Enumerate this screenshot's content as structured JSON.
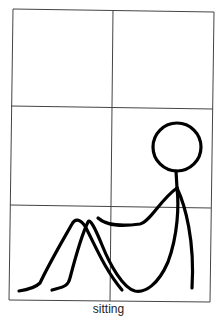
{
  "figure": {
    "caption": "sitting",
    "stroke_color": "#000000",
    "grid_color": "#444444",
    "grid": {
      "rows": 3,
      "cols": 2
    }
  }
}
